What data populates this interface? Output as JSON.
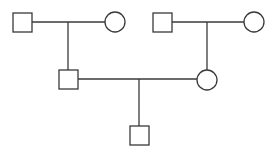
{
  "diagram": {
    "type": "pedigree",
    "stroke_color": "#3a3a3a",
    "background": "#ffffff",
    "individuals": [
      {
        "id": "gen1-male-left",
        "sex": "male",
        "shape": "square",
        "x": 13,
        "y": 13,
        "size": 19
      },
      {
        "id": "gen1-female-left",
        "sex": "female",
        "shape": "circle",
        "cx": 115,
        "cy": 22,
        "r": 10
      },
      {
        "id": "gen1-male-right",
        "sex": "male",
        "shape": "square",
        "x": 153,
        "y": 13,
        "size": 19
      },
      {
        "id": "gen1-female-right",
        "sex": "female",
        "shape": "circle",
        "cx": 254,
        "cy": 22,
        "r": 10
      },
      {
        "id": "gen2-male",
        "sex": "male",
        "shape": "square",
        "x": 59,
        "y": 70,
        "size": 19
      },
      {
        "id": "gen2-female",
        "sex": "female",
        "shape": "circle",
        "cx": 207,
        "cy": 80,
        "r": 10
      },
      {
        "id": "gen3-male",
        "sex": "male",
        "shape": "square",
        "x": 130,
        "y": 126,
        "size": 19
      }
    ],
    "links": [
      {
        "id": "mating-left",
        "x1": 32,
        "y1": 22,
        "x2": 105,
        "y2": 22
      },
      {
        "id": "descent-left",
        "x1": 68,
        "y1": 22,
        "x2": 68,
        "y2": 70
      },
      {
        "id": "mating-right",
        "x1": 172,
        "y1": 22,
        "x2": 244,
        "y2": 22
      },
      {
        "id": "descent-right",
        "x1": 207,
        "y1": 22,
        "x2": 207,
        "y2": 70
      },
      {
        "id": "mating-gen2",
        "x1": 78,
        "y1": 79,
        "x2": 197,
        "y2": 79
      },
      {
        "id": "descent-gen2",
        "x1": 139,
        "y1": 79,
        "x2": 139,
        "y2": 126
      }
    ]
  }
}
